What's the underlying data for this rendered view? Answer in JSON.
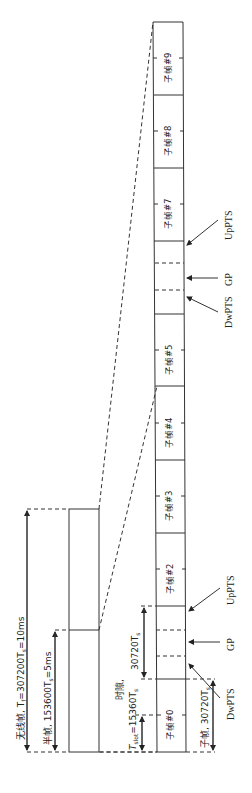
{
  "diagram": {
    "title_radio_frame": "无线帧, T",
    "radio_frame_sub": "f",
    "radio_frame_value": "=307200T",
    "radio_frame_sub2": "s",
    "radio_frame_end": "=10ms",
    "half_frame_label": "半帧, 153600T",
    "half_frame_sub": "s",
    "half_frame_end": "=5ms",
    "slot_label_line1": "时隙,",
    "slot_label_T": "T",
    "slot_label_sub": "slot",
    "slot_label_value": "=15360T",
    "slot_label_sub2": "s",
    "special_len_label": "30720T",
    "special_len_sub": "s",
    "subframe_len_label": "子帧, 30720T",
    "subframe_len_sub": "s",
    "subframes": [
      {
        "label": "子帧#0"
      },
      {
        "label": ""
      },
      {
        "label": "子帧#2"
      },
      {
        "label": "子帧#3"
      },
      {
        "label": "子帧#4"
      },
      {
        "label": "子帧#5"
      },
      {
        "label": ""
      },
      {
        "label": "子帧#7"
      },
      {
        "label": "子帧#8"
      },
      {
        "label": "子帧#9"
      }
    ],
    "special_fields": {
      "dwpts": "DwPTS",
      "gp": "GP",
      "uppts": "UpPTS"
    }
  }
}
